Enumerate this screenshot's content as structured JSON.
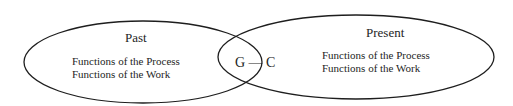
{
  "diagram": {
    "left_ellipse": {
      "title": "Past",
      "lines": [
        "Functions of the Process",
        "Functions of the Work"
      ]
    },
    "right_ellipse": {
      "title": "Present",
      "lines": [
        "Functions of the Process",
        "Functions of the Work"
      ]
    },
    "overlap_label": "G — C",
    "colors": {
      "stroke": "#1e1e1e",
      "background": "#ffffff"
    }
  }
}
